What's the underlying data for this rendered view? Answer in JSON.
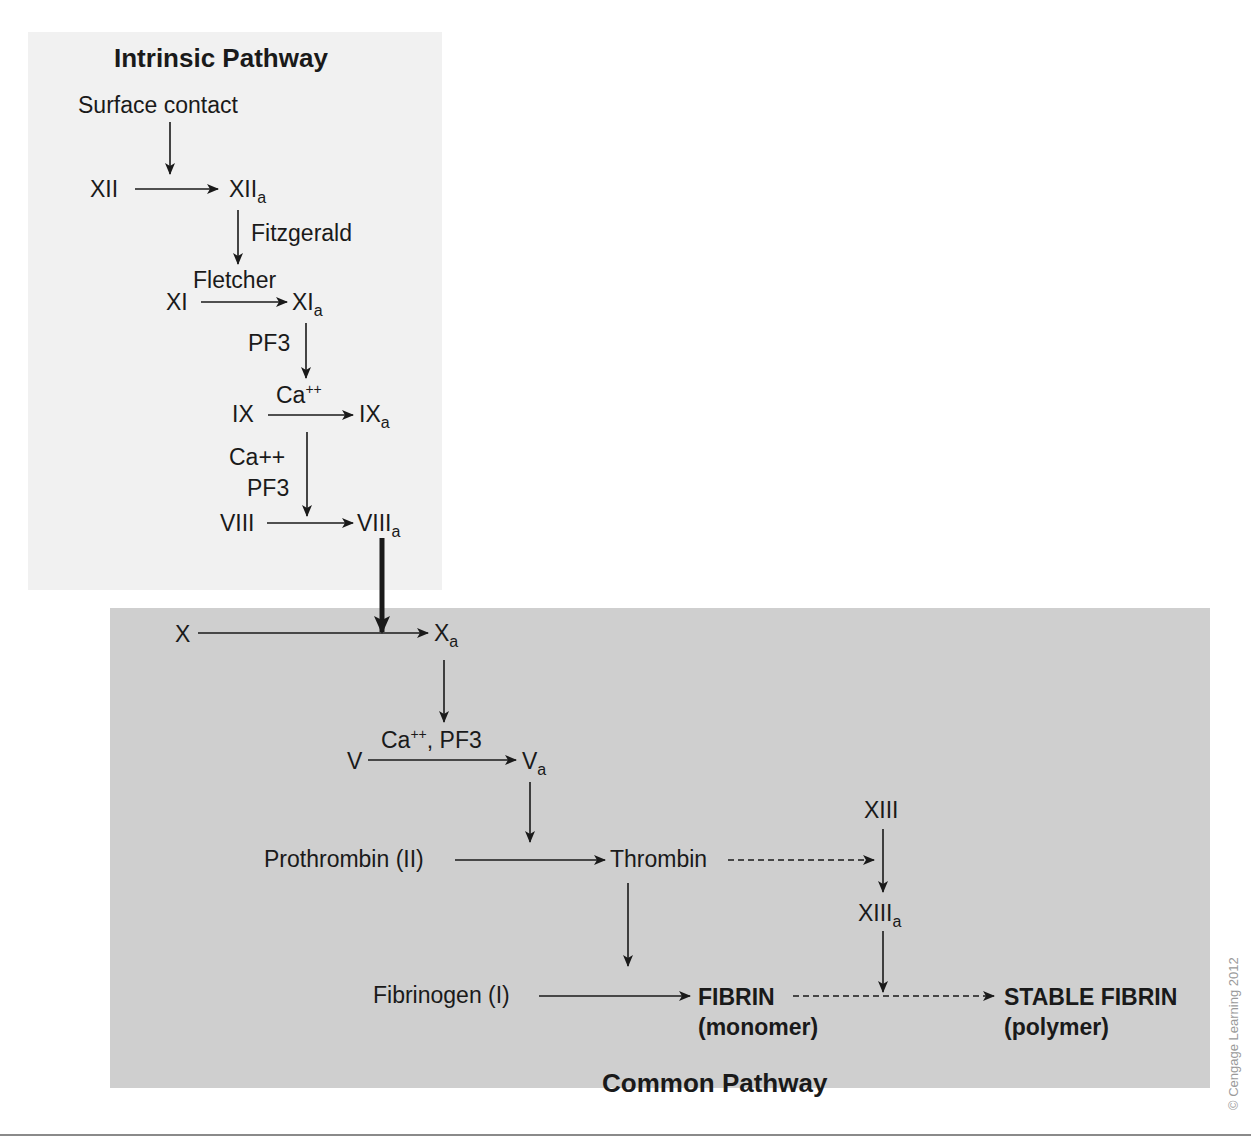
{
  "intrinsic": {
    "title": "Intrinsic Pathway",
    "surface_contact": "Surface contact",
    "xii": "XII",
    "xiia_base": "XII",
    "sub_a": "a",
    "fitzgerald": "Fitzgerald",
    "fletcher": "Fletcher",
    "xi": "XI",
    "xia_base": "XI",
    "pf3_1": "PF3",
    "ca_base": "Ca",
    "ca_sup": "++",
    "ix": "IX",
    "ixa_base": "IX",
    "ca_plain": "Ca++",
    "pf3_2": "PF3",
    "viii": "VIII",
    "viiia_base": "VIII"
  },
  "common": {
    "title": "Common Pathway",
    "x": "X",
    "xa_base": "X",
    "v": "V",
    "va_base": "V",
    "cofactor_ca": "Ca",
    "cofactor_sup": "++",
    "cofactor_rest": ", PF3",
    "prothrombin": "Prothrombin (II)",
    "thrombin": "Thrombin",
    "xiii": "XIII",
    "xiiia_base": "XIII",
    "fibrinogen": "Fibrinogen (I)",
    "fibrin": "FIBRIN",
    "fibrin_sub": "(monomer)",
    "stable_fibrin": "STABLE FIBRIN",
    "stable_fibrin_sub": "(polymer)"
  },
  "copyright": "© Cengage Learning 2012",
  "colors": {
    "intrinsic_bg": "#f1f1f1",
    "common_bg": "#cfcfcf",
    "ink": "#1a1a1a"
  }
}
